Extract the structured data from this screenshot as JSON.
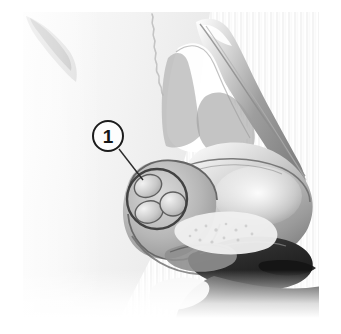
{
  "figure": {
    "view": "left lateral profile",
    "rendering": "grayscale halftone medical illustration",
    "width_px": 341,
    "height_px": 334,
    "background_color": "#ffffff",
    "ink_color": "#1c1c1c"
  },
  "callouts": [
    {
      "number": "1",
      "marker_shape": "circle",
      "marker_center_x": 108,
      "marker_center_y": 136,
      "marker_diameter": 32,
      "leader_line_from_x": 119,
      "leader_line_from_y": 149,
      "leader_line_to_x": 143,
      "leader_line_to_y": 180,
      "target_region": "nasal ala / lower lateral cartilage"
    }
  ],
  "highlight_regions": [
    {
      "shape": "circle",
      "center_x": 157,
      "center_y": 199,
      "radius": 30,
      "label": "highlighted-ala-region"
    },
    {
      "shape": "ellipse",
      "center_x": 148,
      "center_y": 186,
      "radius_x": 14,
      "radius_y": 11,
      "rotation_deg": -22,
      "label": "upper-inner-cartilage-lobule"
    },
    {
      "shape": "ellipse",
      "center_x": 149,
      "center_y": 212,
      "radius_x": 14,
      "radius_y": 11,
      "rotation_deg": -14,
      "label": "lower-inner-cartilage-lobule"
    },
    {
      "shape": "ellipse",
      "center_x": 173,
      "center_y": 204,
      "radius_x": 13,
      "radius_y": 12,
      "rotation_deg": 0,
      "label": "right-inner-cartilage-lobule"
    }
  ],
  "anatomy_parts": [
    {
      "name": "nasal-dorsum",
      "description": "bridge of nose descending diagonally from upper centre to tip"
    },
    {
      "name": "nasion-brow-edge",
      "description": "faint wavy halftone edge at upper area of face"
    },
    {
      "name": "nasal-tip",
      "description": "rounded tip at right of figure"
    },
    {
      "name": "nasal-ala",
      "description": "wing of the nostril, circled as callout target"
    },
    {
      "name": "nostril-opening",
      "description": "dark shaded opening beneath nasal tip"
    },
    {
      "name": "columella",
      "description": "central strip between nostrils at lower area"
    },
    {
      "name": "upper-lip-shadow",
      "description": "dark band at lower right of the figure"
    },
    {
      "name": "cheek-plane",
      "description": "light halftone field occupying left portion"
    },
    {
      "name": "eye-brow-shadow",
      "description": "faint diagonal grey form at top left corner"
    }
  ],
  "palette": {
    "paper_white": "#ffffff",
    "paper_tint": "#f6f6f6",
    "light_grey": "#e2e2e2",
    "mid_grey": "#b4b4b4",
    "shadow_grey": "#8a8a8a",
    "deep_grey": "#5a5a5a",
    "near_black": "#232323",
    "outline": "#1c1c1c"
  }
}
